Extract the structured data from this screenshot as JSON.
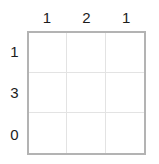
{
  "puzzle": {
    "type": "nonogram-grid",
    "grid": {
      "columns": 3,
      "rows": 3,
      "cells": [
        {
          "state": "empty",
          "value": ""
        },
        {
          "state": "empty",
          "value": ""
        },
        {
          "state": "empty",
          "value": ""
        },
        {
          "state": "empty",
          "value": ""
        },
        {
          "state": "empty",
          "value": ""
        },
        {
          "state": "empty",
          "value": ""
        },
        {
          "state": "empty",
          "value": ""
        },
        {
          "state": "empty",
          "value": ""
        },
        {
          "state": "empty",
          "value": ""
        }
      ]
    },
    "column_clues": [
      {
        "label": "1"
      },
      {
        "label": "2"
      },
      {
        "label": "1"
      }
    ],
    "row_clues": [
      {
        "label": "1"
      },
      {
        "label": "3"
      },
      {
        "label": "0"
      }
    ]
  },
  "colors": {
    "background": "#ffffff",
    "grid_border": "#b3b3b3",
    "grid_line": "#e3e3e3",
    "clue_text": "#1c1c1c"
  }
}
